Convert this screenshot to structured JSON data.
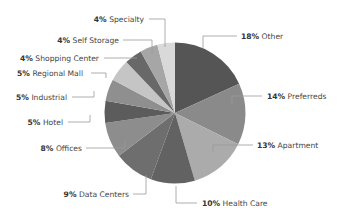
{
  "chart_data": {
    "type": "pie",
    "title": "",
    "start_angle": "12 o'clock",
    "direction": "clockwise",
    "legend": "none (callout labels with leader lines)",
    "categories": [
      "Other",
      "Preferreds",
      "Apartment",
      "Health Care",
      "Data Centers",
      "Offices",
      "Hotel",
      "Industrial",
      "Regional Mall",
      "Shopping Center",
      "Self Storage",
      "Specialty"
    ],
    "values": [
      18,
      14,
      13,
      10,
      9,
      8,
      5,
      5,
      5,
      4,
      4,
      4
    ],
    "unit": "%",
    "colors": [
      "#555555",
      "#8a8a8a",
      "#ababab",
      "#626262",
      "#6e6e6e",
      "#8d8d8d",
      "#5c5c5c",
      "#8f8f8f",
      "#c5c5c5",
      "#686868",
      "#a6a6a6",
      "#d9d9d9"
    ],
    "labels": [
      {
        "pct": "18%",
        "name": "Other"
      },
      {
        "pct": "14%",
        "name": "Preferreds"
      },
      {
        "pct": "13%",
        "name": "Apartment"
      },
      {
        "pct": "10%",
        "name": "Health Care"
      },
      {
        "pct": "9%",
        "name": "Data Centers"
      },
      {
        "pct": "8%",
        "name": "Offices"
      },
      {
        "pct": "5%",
        "name": "Hotel"
      },
      {
        "pct": "5%",
        "name": "Industrial"
      },
      {
        "pct": "5%",
        "name": "Regional Mall"
      },
      {
        "pct": "4%",
        "name": "Shopping Center"
      },
      {
        "pct": "4%",
        "name": "Self Storage"
      },
      {
        "pct": "4%",
        "name": "Specialty"
      }
    ]
  }
}
